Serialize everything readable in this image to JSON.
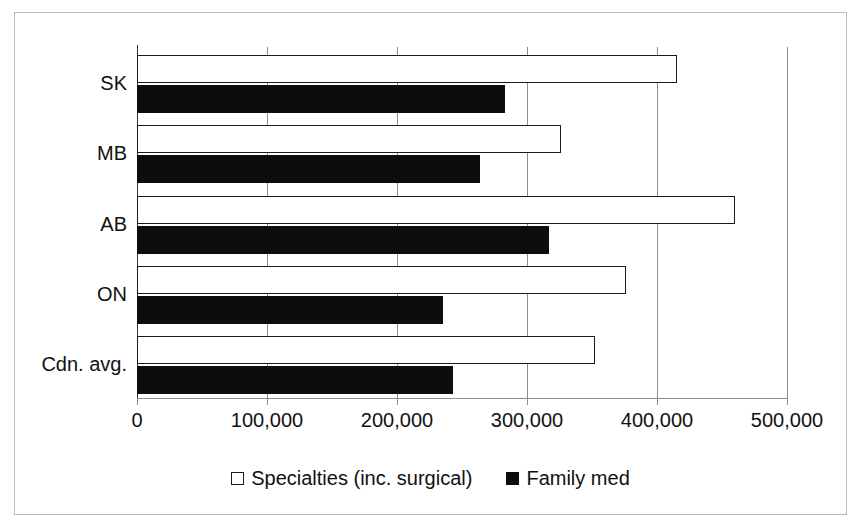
{
  "chart_data": {
    "type": "bar",
    "orientation": "horizontal",
    "title": "",
    "xlabel": "",
    "ylabel": "",
    "categories": [
      "SK",
      "MB",
      "AB",
      "ON",
      "Cdn. avg."
    ],
    "series": [
      {
        "name": "Specialties (inc. surgical)",
        "style": "open",
        "color": "#ffffff",
        "border_color": "#1a1a1a",
        "values": [
          415000,
          326000,
          460000,
          376000,
          352000
        ]
      },
      {
        "name": "Family med",
        "style": "filled",
        "color": "#0d0d0d",
        "border_color": "#0d0d0d",
        "values": [
          283000,
          264000,
          317000,
          235000,
          243000
        ]
      }
    ],
    "xlim": [
      0,
      500000
    ],
    "xticks": [
      0,
      100000,
      200000,
      300000,
      400000,
      500000
    ],
    "xticklabels": [
      "0",
      "100,000",
      "200,000",
      "300,000",
      "400,000",
      "500,000"
    ],
    "grid": {
      "vertical": true,
      "horizontal": false,
      "color": "#8c8c8c"
    },
    "legend": {
      "position": "bottom-center",
      "entries": [
        {
          "label": "Specialties (inc. surgical)",
          "swatch": "open-square-icon"
        },
        {
          "label": "Family med",
          "swatch": "filled-square-icon"
        }
      ]
    },
    "frame": {
      "border_color": "#b9b9b9"
    }
  }
}
